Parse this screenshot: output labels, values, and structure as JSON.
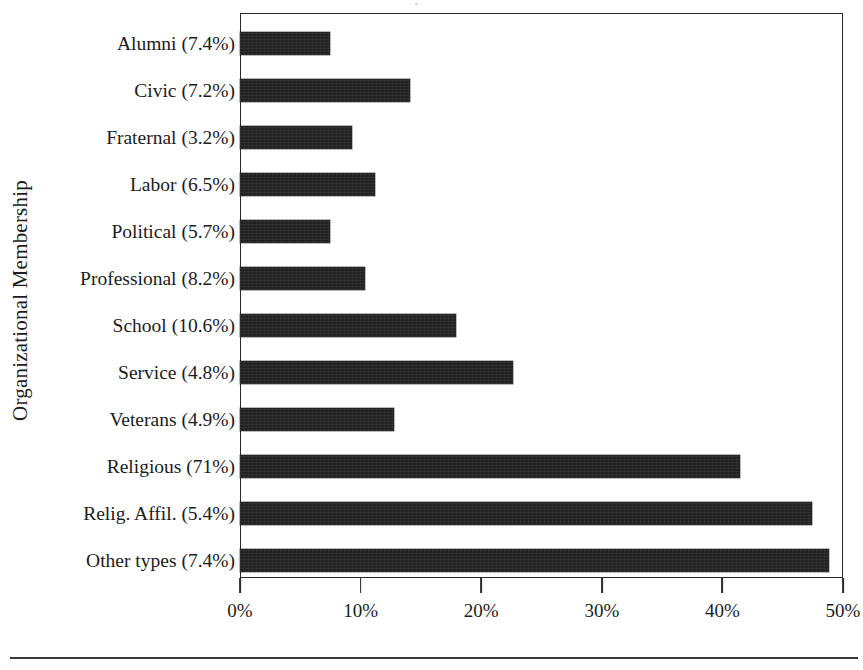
{
  "chart_data": {
    "type": "bar",
    "orientation": "horizontal",
    "title": "",
    "xlabel": "",
    "ylabel": "Organizational Membership",
    "categories": [
      "Alumni (7.4%)",
      "Civic (7.2%)",
      "Fraternal (3.2%)",
      "Labor (6.5%)",
      "Political (5.7%)",
      "Professional (8.2%)",
      "School (10.6%)",
      "Service (4.8%)",
      "Veterans (4.9%)",
      "Religious (71%)",
      "Relig. Affil. (5.4%)",
      "Other types (7.4%)"
    ],
    "category_names": [
      "Alumni",
      "Civic",
      "Fraternal",
      "Labor",
      "Political",
      "Professional",
      "School",
      "Service",
      "Veterans",
      "Religious",
      "Relig. Affil.",
      "Other types"
    ],
    "category_membership_percent": [
      7.4,
      7.2,
      3.2,
      6.5,
      5.7,
      8.2,
      10.6,
      4.8,
      4.9,
      71,
      5.4,
      7.4
    ],
    "values": [
      7.5,
      14.1,
      9.3,
      11.2,
      7.5,
      10.4,
      17.9,
      22.6,
      12.8,
      41.5,
      47.4,
      48.8
    ],
    "xlim": [
      0,
      50
    ],
    "xticks": [
      0,
      10,
      20,
      30,
      40,
      50
    ],
    "xtick_labels": [
      "0%",
      "10%",
      "20%",
      "30%",
      "40%",
      "50%"
    ],
    "grid": false,
    "legend": null,
    "bar_color": "#222222",
    "frame_color": "#2a2a2a",
    "background": "#ffffff"
  },
  "axes": {
    "y_title": "Organizational Membership"
  },
  "artifacts": {
    "top_glyph": "·"
  }
}
